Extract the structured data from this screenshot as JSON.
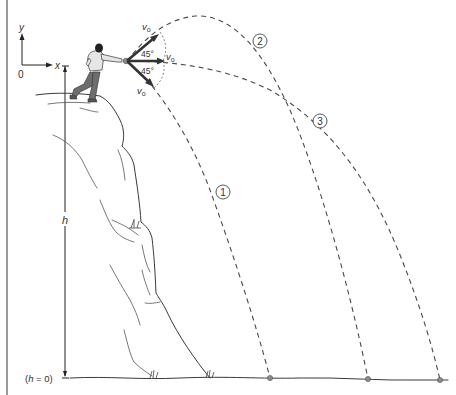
{
  "figure": {
    "type": "projectile-motion-from-cliff",
    "colors": {
      "line": "#3a3a3a",
      "trajectory": "#4a4a4a",
      "vector": "#333333",
      "ball": "#8a8a8a",
      "shirt": "#e6e6e6",
      "pants": "#6e6e6e"
    },
    "axes": {
      "y_label": "y",
      "x_label": "x",
      "origin_label": "0"
    },
    "height_dimension": {
      "label": "h",
      "ground_label": "(h = 0)"
    },
    "launch": {
      "velocity_labels": [
        "v",
        "v",
        "v"
      ],
      "velocity_subscript": "o",
      "angle_upper": "45°",
      "angle_lower": "45°"
    },
    "trajectories": [
      {
        "id": "1",
        "label": "1",
        "direction": "45° below horizontal"
      },
      {
        "id": "2",
        "label": "2",
        "direction": "45° above horizontal"
      },
      {
        "id": "3",
        "label": "3",
        "direction": "horizontal"
      }
    ]
  }
}
